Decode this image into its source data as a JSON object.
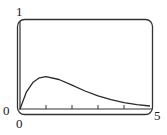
{
  "chart_data": {
    "type": "line",
    "title": "",
    "xlabel": "",
    "ylabel": "",
    "xlim": [
      0,
      5
    ],
    "ylim": [
      0,
      1
    ],
    "grid": false,
    "legend": null,
    "x_tick_marks": [
      1,
      2,
      3,
      4
    ],
    "labels": {
      "y_max": "1",
      "y_min": "0",
      "x_min": "0",
      "x_max": "5"
    },
    "series": [
      {
        "name": "f(x) = x·e^(-x)",
        "x": [
          0,
          0.25,
          0.5,
          0.75,
          1,
          1.5,
          2,
          2.5,
          3,
          3.5,
          4,
          4.5,
          5
        ],
        "y": [
          0,
          0.195,
          0.303,
          0.354,
          0.368,
          0.335,
          0.271,
          0.205,
          0.149,
          0.106,
          0.073,
          0.05,
          0.034
        ]
      }
    ],
    "colors": {
      "frame": "#333333",
      "curve": "#2a2a2a",
      "axis": "#333333"
    }
  }
}
